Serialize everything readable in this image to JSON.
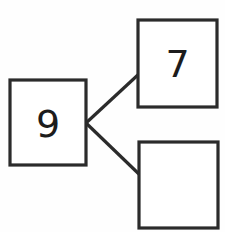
{
  "diagram": {
    "type": "number-bond",
    "background_color": "#fefefe",
    "stroke_color": "#2b2b2b",
    "fill_color": "#ffffff",
    "whole": {
      "name": "whole-box",
      "value": "9",
      "x": 10,
      "y": 80,
      "width": 76,
      "height": 85
    },
    "parts": [
      {
        "name": "part-box-top",
        "value": "7",
        "x": 138,
        "y": 20,
        "width": 79,
        "height": 87
      },
      {
        "name": "part-box-bottom",
        "value": "",
        "x": 139,
        "y": 142,
        "width": 79,
        "height": 86
      }
    ],
    "connectors": [
      {
        "name": "connector-whole-to-top-part",
        "x1": 86,
        "y1": 123,
        "x2": 140,
        "y2": 73
      },
      {
        "name": "connector-whole-to-bottom-part",
        "x1": 86,
        "y1": 123,
        "x2": 141,
        "y2": 176
      }
    ]
  }
}
